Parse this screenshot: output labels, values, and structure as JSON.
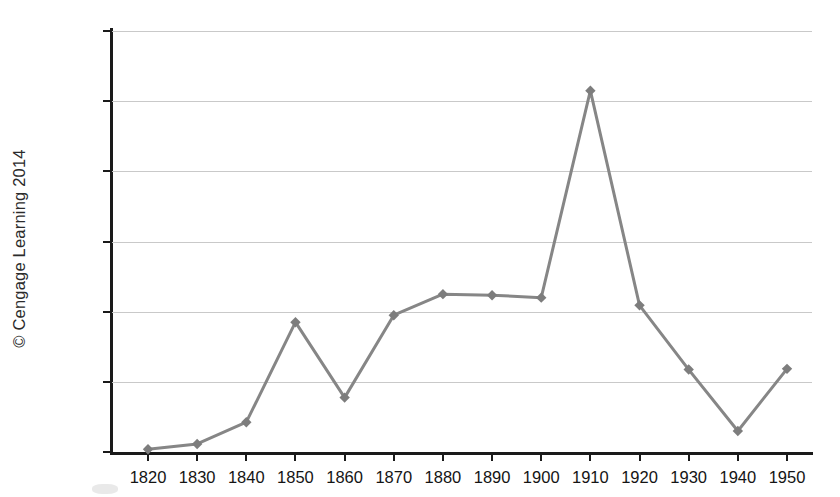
{
  "credit": {
    "text": "© Cengage Learning 2014"
  },
  "chart_data": {
    "type": "line",
    "title": "",
    "subtitle": "",
    "xlabel": "",
    "ylabel": "",
    "categories": [
      "1820",
      "1830",
      "1840",
      "1850",
      "1860",
      "1870",
      "1880",
      "1890",
      "1900",
      "1910",
      "1920",
      "1930",
      "1940",
      "1950"
    ],
    "x": [
      1820,
      1830,
      1840,
      1850,
      1860,
      1870,
      1880,
      1890,
      1900,
      1910,
      1920,
      1930,
      1940,
      1950
    ],
    "values": [
      8000,
      23000,
      85000,
      370000,
      155000,
      390000,
      450000,
      447000,
      440000,
      1030000,
      418000,
      235000,
      60000,
      237000
    ],
    "series": [
      {
        "name": "Immigration",
        "values": [
          8000,
          23000,
          85000,
          370000,
          155000,
          390000,
          450000,
          447000,
          440000,
          1030000,
          418000,
          235000,
          60000,
          237000
        ]
      }
    ],
    "ylim": [
      0,
      1200000
    ],
    "ytick_values": [
      0,
      200000,
      400000,
      600000,
      800000,
      1000000,
      1200000
    ],
    "ytick_labels": [
      "0",
      "200,000",
      "400,000",
      "600,000",
      "800,000",
      "1,000,000",
      "1,200,000"
    ],
    "xtick_labels": [
      "1820",
      "1830",
      "1840",
      "1850",
      "1860",
      "1870",
      "1880",
      "1890",
      "1900",
      "1910",
      "1920",
      "1930",
      "1940",
      "1950"
    ],
    "grid": true,
    "grid_axis": "y",
    "legend": false,
    "legend_position": "none",
    "marker": "diamond",
    "line_color": "#868686",
    "marker_color": "#7d7d7d",
    "grid_color": "#c9c9c9",
    "axis_color": "#1a1a1a",
    "background_color": "#ffffff",
    "annotations": []
  }
}
